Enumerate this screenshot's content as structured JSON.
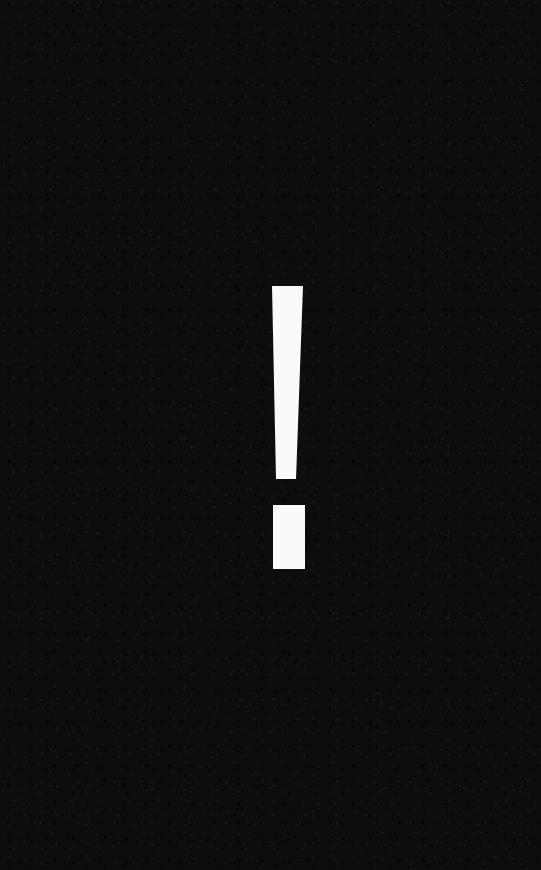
{
  "image": {
    "width": 541,
    "height": 870,
    "background_color": "#0d0d0d",
    "has_grain": true
  },
  "symbol": {
    "name": "exclamation-mark",
    "character": "!",
    "fill_color": "#fafafa",
    "stroke": {
      "top_y": 286,
      "bottom_y": 479,
      "top_left_x": 272,
      "top_right_x": 303,
      "bottom_left_x": 276,
      "bottom_right_x": 296
    },
    "dot": {
      "x": 273,
      "y": 505,
      "width": 32,
      "height": 64
    }
  }
}
